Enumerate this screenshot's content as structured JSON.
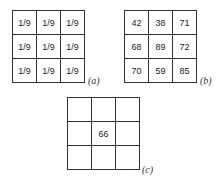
{
  "panels": [
    {
      "label": "(a)",
      "cells": [
        "1/9",
        "1/9",
        "1/9",
        "1/9",
        "1/9",
        "1/9",
        "1/9",
        "1/9",
        "1/9"
      ]
    },
    {
      "label": "(b)",
      "cells": [
        "42",
        "38",
        "71",
        "68",
        "89",
        "72",
        "70",
        "59",
        "85"
      ]
    },
    {
      "label": "(c)",
      "cells": [
        "",
        "",
        "",
        "",
        "66",
        "",
        "",
        "",
        ""
      ]
    }
  ]
}
